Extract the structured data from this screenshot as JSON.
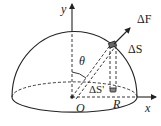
{
  "diagram": {
    "type": "hemisphere-projection",
    "labels": {
      "y_axis": "y",
      "x_axis": "x",
      "origin": "O",
      "radius": "R",
      "angle": "θ",
      "force": "ΔF",
      "area_element": "ΔS",
      "projected_area": "ΔS'"
    },
    "colors": {
      "stroke": "#222222",
      "background": "#ffffff",
      "patch_fill": "#666666"
    }
  }
}
